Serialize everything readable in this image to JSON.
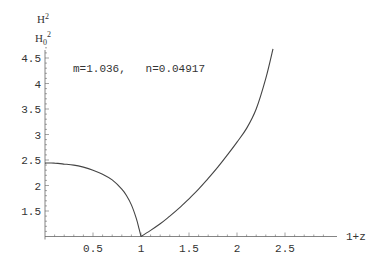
{
  "chart_data": {
    "type": "line",
    "title": "",
    "xlabel": "1+z",
    "ylabel": "H^2 / H_0^2",
    "ylabel_top": "H",
    "ylabel_top_sup": "2",
    "ylabel_bottom": "H",
    "ylabel_bottom_sub": "0",
    "ylabel_bottom_sup": "2",
    "annotation": "m=1.036,   n=0.04917",
    "xlim": [
      0,
      3.0
    ],
    "ylim": [
      1.0,
      4.7
    ],
    "grid": false,
    "legend": null,
    "x_ticks": [
      0.5,
      1,
      1.5,
      2,
      2.5
    ],
    "x_tick_labels": [
      "0.5",
      "1",
      "1.5",
      "2",
      "2.5"
    ],
    "y_ticks": [
      1.5,
      2,
      2.5,
      3,
      3.5,
      4,
      4.5
    ],
    "y_tick_labels": [
      "1.5",
      "2",
      "2.5",
      "3",
      "3.5",
      "4",
      "4.5"
    ],
    "series": [
      {
        "name": "left branch",
        "x": [
          0.0,
          0.1,
          0.2,
          0.3,
          0.4,
          0.5,
          0.6,
          0.7,
          0.8,
          0.85,
          0.9,
          0.95,
          0.98,
          1.0
        ],
        "values": [
          2.44,
          2.44,
          2.42,
          2.4,
          2.36,
          2.3,
          2.22,
          2.11,
          1.93,
          1.8,
          1.62,
          1.36,
          1.15,
          1.0
        ]
      },
      {
        "name": "right branch",
        "x": [
          1.0,
          1.1,
          1.2,
          1.3,
          1.4,
          1.5,
          1.6,
          1.7,
          1.8,
          1.9,
          2.0,
          2.1,
          2.2,
          2.3,
          2.375
        ],
        "values": [
          1.0,
          1.12,
          1.25,
          1.4,
          1.56,
          1.74,
          1.93,
          2.14,
          2.36,
          2.6,
          2.85,
          3.12,
          3.5,
          4.1,
          4.68
        ]
      }
    ]
  }
}
